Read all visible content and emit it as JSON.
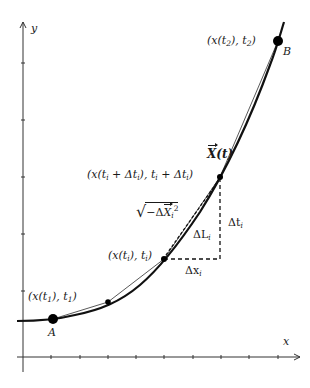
{
  "axes": {
    "x_label": "x",
    "y_label": "y",
    "x_ticks_px": [
      51,
      80,
      108,
      136,
      164,
      193,
      221,
      249,
      278
    ],
    "y_ticks_px": [
      63,
      120,
      177,
      234,
      291
    ]
  },
  "points": {
    "A": {
      "name": "A",
      "coord_label": "(x(t",
      "sub": "1",
      "tail": "), t",
      "sub2": "1",
      "end": ")"
    },
    "B": {
      "name": "B",
      "coord_label": "(x(t",
      "sub": "2",
      "tail": "), t",
      "sub2": "2",
      "end": ")"
    },
    "Pi": {
      "coord_label": "(x(t",
      "sub": "i",
      "tail": "), t",
      "sub2": "i",
      "end": ")"
    },
    "Pi1": {
      "part1": "(x(t",
      "sub1": "i",
      "part2": " + Δt",
      "sub2": "i",
      "part3": "), t",
      "sub3": "i",
      "part4": " + Δt",
      "sub4": "i",
      "part5": ")"
    }
  },
  "curve_label": {
    "vec": "X",
    "rest": "(t)"
  },
  "annotations": {
    "delta_t": {
      "text": "Δt",
      "sub": "i"
    },
    "delta_x": {
      "text": "Δx",
      "sub": "i"
    },
    "delta_L": {
      "text": "ΔL",
      "sub": "i"
    },
    "sqrt_expr": {
      "prefix": "−Δ",
      "vec": "X",
      "sub": "i",
      "sup": "2"
    }
  },
  "colors": {
    "curve": "#111111",
    "axis": "#333333",
    "points": "#000000",
    "text": "#1a1a1a"
  },
  "chart_data": {
    "type": "line",
    "title": "",
    "xlabel": "x",
    "ylabel": "y",
    "points": [
      {
        "label": "A",
        "x": 1.0,
        "y": 1.1
      },
      {
        "label": "intermediate",
        "x": 3.0,
        "y": 1.6
      },
      {
        "label": "(x(t_i), t_i)",
        "x": 5.0,
        "y": 3.0
      },
      {
        "label": "(x(t_i+Δt_i), t_i+Δt_i)",
        "x": 7.0,
        "y": 5.7
      },
      {
        "label": "B",
        "x": 9.0,
        "y": 10.2
      }
    ],
    "grid": false,
    "legend": null
  }
}
